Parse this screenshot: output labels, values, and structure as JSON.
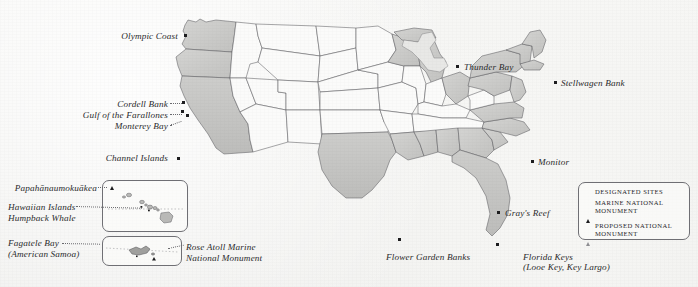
{
  "map": {
    "title": "United States Marine Protected Areas Map",
    "background_color": "#f3f3f1",
    "state_fill_interior": "#fbfbfa",
    "state_fill_coastal": "#cfcfcd",
    "state_border_color": "#5e5e62",
    "marker_color": "#1d1d1f",
    "proposed_marker_color": "#8e8e92"
  },
  "legend": {
    "items": [
      {
        "marker": "square-marker",
        "label": "Designated Sites"
      },
      {
        "marker": "filled-triangle-marker",
        "label": "Marine National Monument"
      },
      {
        "marker": "open-triangle-marker",
        "label": "Proposed National Monument"
      }
    ]
  },
  "labels": {
    "olympic_coast": "Olympic Coast",
    "cordell_bank": "Cordell Bank",
    "gulf_of_the_farallones": "Gulf of the Farallones",
    "monterey_bay": "Monterey Bay",
    "channel_islands": "Channel Islands",
    "thunder_bay": "Thunder Bay",
    "stellwagen_bank": "Stellwagen Bank",
    "monitor": "Monitor",
    "grays_reef": "Gray's Reef",
    "flower_garden_banks": "Flower Garden Banks",
    "florida_keys_line1": "Florida Keys",
    "florida_keys_line2": "(Looe Key, Key Largo)",
    "papahanaumokuakea": "Papahānaumokuākea",
    "hawaiian_islands_line1": "Hawaiian Islands",
    "hawaiian_islands_line2": "Humpback Whale",
    "fagatele_bay_line1": "Fagatele Bay",
    "fagatele_bay_line2": "(American Samoa)",
    "rose_atoll_line1": "Rose Atoll Marine",
    "rose_atoll_line2": "National Monument"
  },
  "sites": [
    {
      "name": "Olympic Coast",
      "marker": "square-marker"
    },
    {
      "name": "Cordell Bank",
      "marker": "square-marker"
    },
    {
      "name": "Gulf of the Farallones",
      "marker": "square-marker"
    },
    {
      "name": "Monterey Bay",
      "marker": "square-marker"
    },
    {
      "name": "Channel Islands",
      "marker": "square-marker"
    },
    {
      "name": "Thunder Bay",
      "marker": "square-marker"
    },
    {
      "name": "Stellwagen Bank",
      "marker": "square-marker"
    },
    {
      "name": "Monitor",
      "marker": "square-marker"
    },
    {
      "name": "Gray's Reef",
      "marker": "square-marker"
    },
    {
      "name": "Flower Garden Banks",
      "marker": "square-marker"
    },
    {
      "name": "Florida Keys",
      "marker": "square-marker"
    },
    {
      "name": "Papahānaumokuākea",
      "marker": "filled-triangle-marker"
    },
    {
      "name": "Hawaiian Islands Humpback Whale",
      "marker": "square-marker"
    },
    {
      "name": "Fagatele Bay",
      "marker": "square-marker"
    },
    {
      "name": "Rose Atoll Marine National Monument",
      "marker": "filled-triangle-marker"
    }
  ]
}
